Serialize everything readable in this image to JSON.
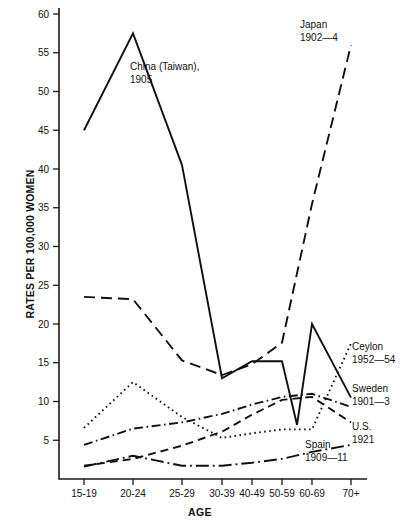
{
  "chart_data": {
    "type": "line",
    "title": "",
    "xlabel": "AGE",
    "ylabel": "RATES PER 100,000 WOMEN",
    "categories": [
      "15-19",
      "20-24",
      "25-29",
      "30-39",
      "40-49",
      "50-59",
      "60-69",
      "70+"
    ],
    "ylim": [
      0,
      60
    ],
    "ytick_step": 5,
    "yticks": [
      "5",
      "10",
      "15",
      "20",
      "25",
      "30",
      "35",
      "40",
      "45",
      "50",
      "55",
      "60"
    ],
    "grid": false,
    "legend_position": "inline-annotations",
    "series": [
      {
        "name": "China (Taiwan), 1905",
        "label_line1": "China (Taiwan),",
        "label_line2": "1905",
        "style": "solid",
        "values": [
          45.0,
          57.5,
          40.5,
          13.0,
          15.2,
          15.2,
          20.0,
          10.5
        ],
        "extra_points": [
          {
            "x": "55-59",
            "value": 7.0
          }
        ]
      },
      {
        "name": "Japan 1902-4",
        "label_line1": "Japan",
        "label_line2": "1902—4",
        "style": "dashed",
        "values": [
          23.5,
          23.2,
          15.3,
          13.4,
          14.8,
          17.6,
          35.5,
          56.0
        ]
      },
      {
        "name": "Ceylon 1952-54",
        "label_line1": "Ceylon",
        "label_line2": "1952—54",
        "style": "dotted",
        "values": [
          6.6,
          12.5,
          8.0,
          5.3,
          5.9,
          6.4,
          6.4,
          17.5
        ]
      },
      {
        "name": "Sweden 1901-3",
        "label_line1": "Sweden",
        "label_line2": "1901—3",
        "style": "dash-dot",
        "values": [
          4.4,
          6.5,
          7.3,
          8.4,
          9.6,
          10.6,
          11.0,
          9.3
        ]
      },
      {
        "name": "U.S. 1921",
        "label_line1": "U.S.",
        "label_line2": "1921",
        "style": "dashed-short",
        "values": [
          1.7,
          2.6,
          4.3,
          6.1,
          8.3,
          10.2,
          10.6,
          7.3
        ]
      },
      {
        "name": "Spain 1909-11",
        "label_line1": "Spain",
        "label_line2": "1909—11",
        "style": "dash-dot-long",
        "values": [
          1.6,
          3.0,
          1.7,
          1.7,
          2.1,
          2.6,
          3.5,
          4.4
        ]
      }
    ]
  },
  "axes": {
    "y_axis_label": "RATES PER 100,000 WOMEN",
    "x_axis_label": "AGE"
  }
}
